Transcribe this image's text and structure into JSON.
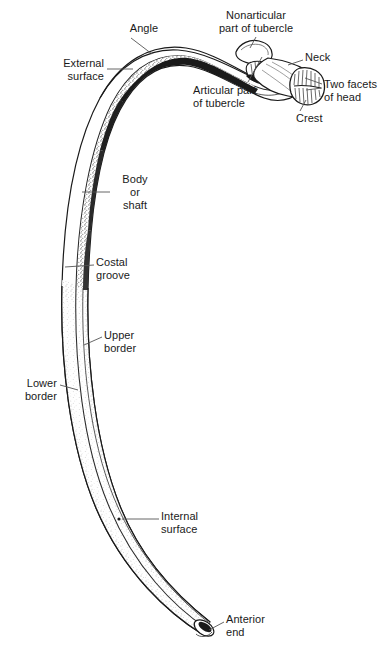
{
  "figure": {
    "view": "posterior view of a typical rib",
    "background_color": "#ffffff",
    "ink_color": "#1a1a1a",
    "leader_color": "#555555"
  },
  "labels": [
    {
      "id": "angle",
      "text": "Angle",
      "align": "center",
      "x": 121,
      "y": 22,
      "width": 46,
      "leader": {
        "x1": 131,
        "y1": 38,
        "x2": 152,
        "y2": 54
      }
    },
    {
      "id": "nonarticular-part-of-tubercle",
      "text": "Nonarticular\npart of tubercle",
      "align": "center",
      "x": 198,
      "y": 9,
      "width": 116,
      "leader": {
        "x1": 256,
        "y1": 37,
        "x2": 250,
        "y2": 48
      }
    },
    {
      "id": "neck",
      "text": "Neck",
      "align": "left",
      "x": 305,
      "y": 51,
      "width": 36,
      "leader": {
        "x1": 303,
        "y1": 60,
        "x2": 288,
        "y2": 65
      }
    },
    {
      "id": "external-surface",
      "text": "External\nsurface",
      "align": "right",
      "x": 37,
      "y": 57,
      "width": 67,
      "leader": {
        "x1": 107,
        "y1": 69,
        "x2": 133,
        "y2": 69
      }
    },
    {
      "id": "articular-part-of-tubercle",
      "text": "Articular part\nof tubercle",
      "align": "left",
      "x": 193,
      "y": 84,
      "width": 82,
      "leader": {
        "x1": 248,
        "y1": 82,
        "x2": 262,
        "y2": 57
      }
    },
    {
      "id": "two-facets-of-head",
      "text": "Two facets\nof head",
      "align": "left",
      "x": 324,
      "y": 78,
      "width": 66,
      "leader": {
        "x1": 322,
        "y1": 84,
        "x2": 305,
        "y2": 78
      },
      "leader2": {
        "x1": 322,
        "y1": 88,
        "x2": 306,
        "y2": 90
      }
    },
    {
      "id": "crest",
      "text": "Crest",
      "align": "left",
      "x": 296,
      "y": 112,
      "width": 36,
      "leader": {
        "x1": 300,
        "y1": 111,
        "x2": 306,
        "y2": 100
      }
    },
    {
      "id": "body-or-shaft",
      "text": "Body\nor\nshaft",
      "align": "center",
      "x": 112,
      "y": 173,
      "width": 46,
      "leader": {
        "x1": 110,
        "y1": 192,
        "x2": 82,
        "y2": 192
      }
    },
    {
      "id": "costal-groove",
      "text": "Costal\ngroove",
      "align": "left",
      "x": 96,
      "y": 256,
      "width": 48,
      "leader": {
        "x1": 94,
        "y1": 265,
        "x2": 65,
        "y2": 267
      }
    },
    {
      "id": "upper-border",
      "text": "Upper\nborder",
      "align": "left",
      "x": 104,
      "y": 329,
      "width": 46,
      "leader": {
        "x1": 102,
        "y1": 337,
        "x2": 84,
        "y2": 345
      }
    },
    {
      "id": "lower-border",
      "text": "Lower\nborder",
      "align": "right",
      "x": 10,
      "y": 377,
      "width": 47,
      "leader": {
        "x1": 60,
        "y1": 385,
        "x2": 78,
        "y2": 390
      }
    },
    {
      "id": "internal-surface",
      "text": "Internal\nsurface",
      "align": "left",
      "x": 161,
      "y": 510,
      "width": 55,
      "leader": {
        "x1": 159,
        "y1": 519,
        "x2": 122,
        "y2": 519
      },
      "dot": {
        "cx": 119,
        "cy": 519,
        "r": 1.6
      }
    },
    {
      "id": "anterior-end",
      "text": "Anterior\nend",
      "align": "left",
      "x": 226,
      "y": 613,
      "width": 58,
      "leader": {
        "x1": 224,
        "y1": 622,
        "x2": 209,
        "y2": 630
      }
    }
  ]
}
